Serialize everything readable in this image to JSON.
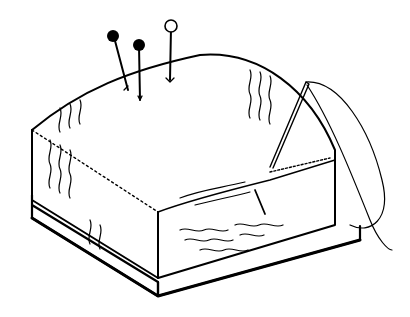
{
  "image": {
    "subject": "Line drawing of a square pincushion with pins and a threaded needle",
    "background_color": "#ffffff",
    "ink_color": "#000000",
    "elements": {
      "pins": [
        {
          "name": "black-head-pin-left",
          "head": "filled"
        },
        {
          "name": "black-head-pin-middle",
          "head": "filled"
        },
        {
          "name": "white-head-pin-right",
          "head": "hollow"
        }
      ],
      "needle": {
        "threaded": true
      },
      "cushion": {
        "shape": "square",
        "pattern": "wavy lines",
        "base": "square board"
      }
    }
  }
}
